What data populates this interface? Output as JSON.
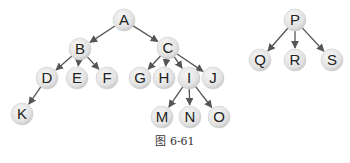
{
  "diagram": {
    "type": "forest",
    "caption": "图 6-61",
    "node_radius": 11,
    "colors": {
      "node_fill_light": "#f4f4f4",
      "node_fill_dark": "#c8c8c8",
      "edge": "#555555",
      "label": "#222222"
    },
    "nodes": [
      {
        "id": "A",
        "x": 124,
        "y": 20
      },
      {
        "id": "B",
        "x": 80,
        "y": 49
      },
      {
        "id": "C",
        "x": 168,
        "y": 48
      },
      {
        "id": "D",
        "x": 47,
        "y": 78
      },
      {
        "id": "E",
        "x": 77,
        "y": 78
      },
      {
        "id": "F",
        "x": 107,
        "y": 78
      },
      {
        "id": "G",
        "x": 140,
        "y": 78
      },
      {
        "id": "H",
        "x": 164,
        "y": 78
      },
      {
        "id": "I",
        "x": 189,
        "y": 78
      },
      {
        "id": "J",
        "x": 213,
        "y": 78
      },
      {
        "id": "K",
        "x": 22,
        "y": 114
      },
      {
        "id": "M",
        "x": 162,
        "y": 117
      },
      {
        "id": "N",
        "x": 190,
        "y": 117
      },
      {
        "id": "O",
        "x": 219,
        "y": 117
      },
      {
        "id": "P",
        "x": 295,
        "y": 20
      },
      {
        "id": "Q",
        "x": 260,
        "y": 60
      },
      {
        "id": "R",
        "x": 295,
        "y": 60
      },
      {
        "id": "S",
        "x": 332,
        "y": 60
      }
    ],
    "edges": [
      {
        "from": "A",
        "to": "B"
      },
      {
        "from": "A",
        "to": "C"
      },
      {
        "from": "B",
        "to": "D"
      },
      {
        "from": "B",
        "to": "E"
      },
      {
        "from": "B",
        "to": "F"
      },
      {
        "from": "C",
        "to": "G"
      },
      {
        "from": "C",
        "to": "H"
      },
      {
        "from": "C",
        "to": "I"
      },
      {
        "from": "C",
        "to": "J"
      },
      {
        "from": "D",
        "to": "K"
      },
      {
        "from": "I",
        "to": "M"
      },
      {
        "from": "I",
        "to": "N"
      },
      {
        "from": "I",
        "to": "O"
      },
      {
        "from": "P",
        "to": "Q"
      },
      {
        "from": "P",
        "to": "R"
      },
      {
        "from": "P",
        "to": "S"
      }
    ]
  }
}
